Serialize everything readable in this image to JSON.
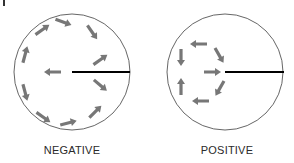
{
  "diagram": {
    "panels": [
      {
        "id": "negative",
        "label": "NEGATIVE",
        "circle": {
          "cx": 72,
          "cy": 72,
          "r": 58
        },
        "radius_line": {
          "x1": 72,
          "y1": 72,
          "x2": 130,
          "y2": 72
        },
        "arrow_pattern": "circulation around center, center arrow points left (away from line)",
        "arrows": [
          {
            "x": 63,
            "y": 22,
            "angle": 20
          },
          {
            "x": 92,
            "y": 32,
            "angle": 55
          },
          {
            "x": 100,
            "y": 60,
            "angle": -35
          },
          {
            "x": 100,
            "y": 85,
            "angle": 40
          },
          {
            "x": 95,
            "y": 112,
            "angle": -45
          },
          {
            "x": 68,
            "y": 123,
            "angle": -15
          },
          {
            "x": 43,
            "y": 117,
            "angle": 35
          },
          {
            "x": 25,
            "y": 92,
            "angle": 75
          },
          {
            "x": 25,
            "y": 55,
            "angle": -75
          },
          {
            "x": 42,
            "y": 30,
            "angle": -35
          },
          {
            "x": 53,
            "y": 72,
            "angle": 180
          }
        ]
      },
      {
        "id": "positive",
        "label": "POSITIVE",
        "circle": {
          "cx": 225,
          "cy": 72,
          "r": 58
        },
        "radius_line": {
          "x1": 225,
          "y1": 72,
          "x2": 284,
          "y2": 72
        },
        "arrow_pattern": "small loop on left side, center arrow points right (toward line)",
        "arrows": [
          {
            "x": 199,
            "y": 44,
            "angle": 180
          },
          {
            "x": 219,
            "y": 55,
            "angle": 60
          },
          {
            "x": 212,
            "y": 72,
            "angle": 0
          },
          {
            "x": 220,
            "y": 88,
            "angle": 120
          },
          {
            "x": 201,
            "y": 101,
            "angle": 180
          },
          {
            "x": 181,
            "y": 87,
            "angle": -90
          },
          {
            "x": 181,
            "y": 57,
            "angle": 90
          }
        ]
      }
    ],
    "colors": {
      "circle_stroke": "#555555",
      "radius_line": "#000000",
      "arrow_fill": "#777777"
    }
  }
}
